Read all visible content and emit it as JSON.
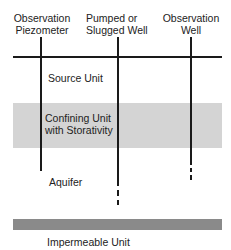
{
  "diagram": {
    "wells": [
      {
        "label_line1": "Observation",
        "label_line2": "Piezometer"
      },
      {
        "label_line1": "Pumped or",
        "label_line2": "Slugged Well"
      },
      {
        "label_line1": "Observation",
        "label_line2": "Well"
      }
    ],
    "layers": {
      "source": "Source Unit",
      "confining_line1": "Confining Unit",
      "confining_line2": "with Storativity",
      "aquifer": "Aquifer",
      "impermeable": "Impermeable Unit"
    },
    "colors": {
      "line": "#1a1a1a",
      "confining_band": "#d4d4d4",
      "impermeable_band": "#8a8a8a"
    }
  }
}
